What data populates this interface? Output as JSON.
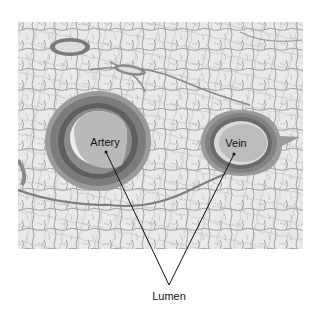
{
  "figure": {
    "labels": {
      "artery": "Artery",
      "vein": "Vein",
      "lumen": "Lumen"
    },
    "colors": {
      "background": "#ffffff",
      "tissue_bg": "#e6e6e6",
      "fat_septa": "#8c8c8c",
      "vessel_wall_dark": "#6e6e6e",
      "vessel_wall_mid": "#8a8a8a",
      "lumen_fill": "#b9b9b9",
      "leader_line": "#111111"
    }
  }
}
